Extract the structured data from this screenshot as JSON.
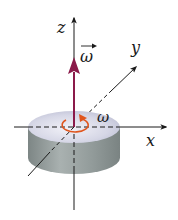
{
  "diagram": {
    "axes": {
      "x_label": "x",
      "y_label": "y",
      "z_label": "z"
    },
    "angular_velocity_vector_label": "ω",
    "rotation_label": "ω",
    "colors": {
      "axis": "#1a1a1a",
      "omega_vector": "#8b1a4a",
      "rotation_arrow": "#e0561e",
      "disk_top": "#cfd0e0",
      "disk_side": "#8e9796"
    }
  }
}
